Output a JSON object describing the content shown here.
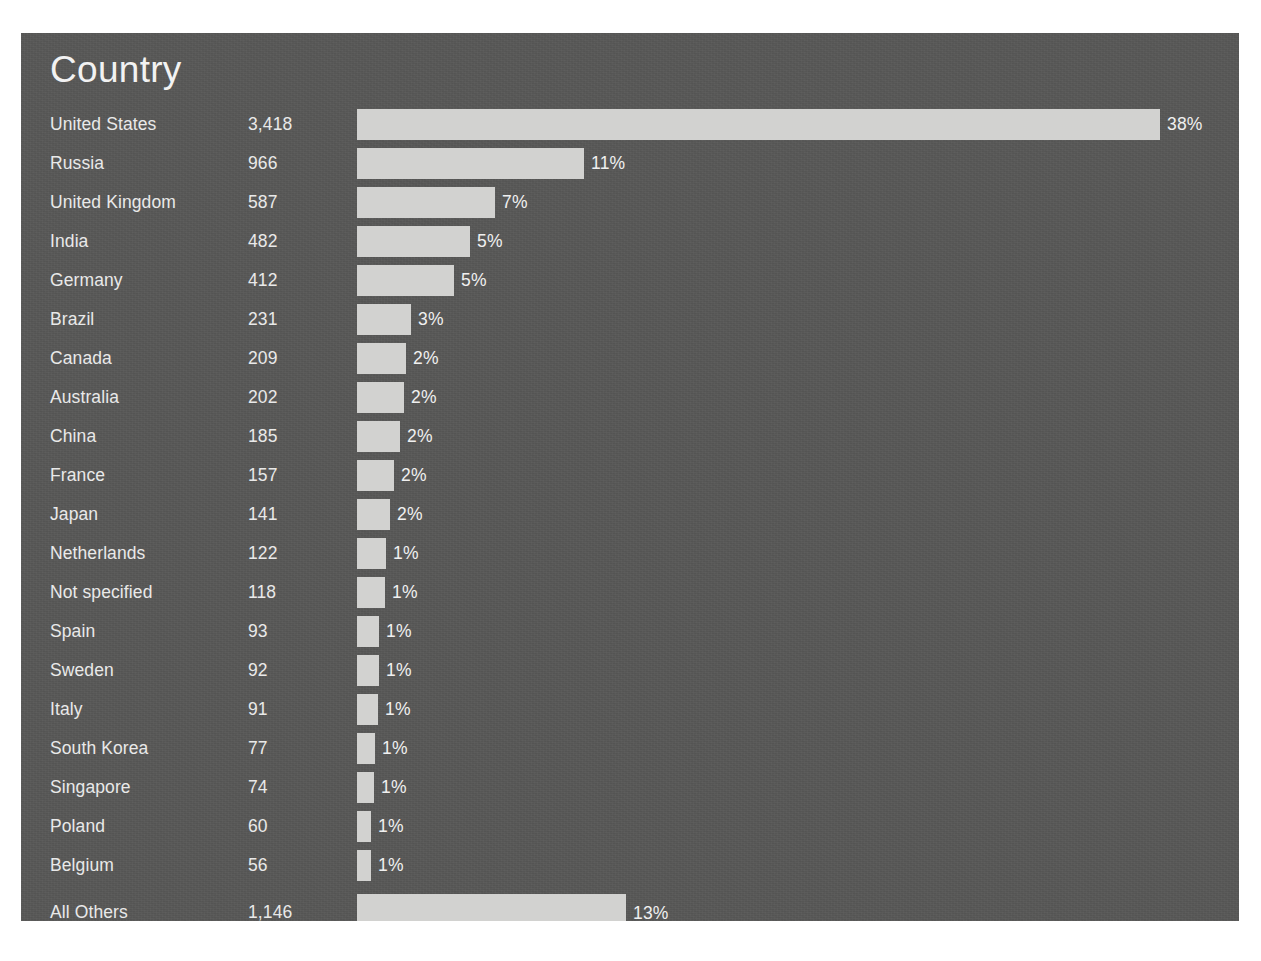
{
  "panel": {
    "background_color": "#585857",
    "bar_color": "#d2d2d0",
    "text_color": "#e9e9e9"
  },
  "header": {
    "title": "Country"
  },
  "chart_data": {
    "type": "bar",
    "orientation": "horizontal",
    "title": "Country",
    "xlabel": "",
    "ylabel": "",
    "grid": false,
    "legend": "none",
    "value_label_format": "percent",
    "max_value": 3418,
    "axis_max": 3418,
    "categories": [
      "United States",
      "Russia",
      "United Kingdom",
      "India",
      "Germany",
      "Brazil",
      "Canada",
      "Australia",
      "China",
      "France",
      "Japan",
      "Netherlands",
      "Not specified",
      "Spain",
      "Sweden",
      "Italy",
      "South Korea",
      "Singapore",
      "Poland",
      "Belgium",
      "All Others"
    ],
    "values": [
      3418,
      966,
      587,
      482,
      412,
      231,
      209,
      202,
      185,
      157,
      141,
      122,
      118,
      93,
      92,
      91,
      77,
      74,
      60,
      56,
      1146
    ],
    "value_labels": [
      "3,418",
      "966",
      "587",
      "482",
      "412",
      "231",
      "209",
      "202",
      "185",
      "157",
      "141",
      "122",
      "118",
      "93",
      "92",
      "91",
      "77",
      "74",
      "60",
      "56",
      "1,146"
    ],
    "percent_labels": [
      "38%",
      "11%",
      "7%",
      "5%",
      "5%",
      "3%",
      "2%",
      "2%",
      "2%",
      "2%",
      "2%",
      "1%",
      "1%",
      "1%",
      "1%",
      "1%",
      "1%",
      "1%",
      "1%",
      "1%",
      "13%"
    ],
    "percents": [
      38,
      11,
      7,
      5,
      5,
      3,
      2,
      2,
      2,
      2,
      2,
      1,
      1,
      1,
      1,
      1,
      1,
      1,
      1,
      1,
      13
    ]
  },
  "rows": [
    {
      "label": "United States",
      "value": "3,418",
      "percent_label": "38%",
      "count": 3418,
      "separated": false
    },
    {
      "label": "Russia",
      "value": "966",
      "percent_label": "11%",
      "count": 966,
      "separated": false
    },
    {
      "label": "United Kingdom",
      "value": "587",
      "percent_label": "7%",
      "count": 587,
      "separated": false
    },
    {
      "label": "India",
      "value": "482",
      "percent_label": "5%",
      "count": 482,
      "separated": false
    },
    {
      "label": "Germany",
      "value": "412",
      "percent_label": "5%",
      "count": 412,
      "separated": false
    },
    {
      "label": "Brazil",
      "value": "231",
      "percent_label": "3%",
      "count": 231,
      "separated": false
    },
    {
      "label": "Canada",
      "value": "209",
      "percent_label": "2%",
      "count": 209,
      "separated": false
    },
    {
      "label": "Australia",
      "value": "202",
      "percent_label": "2%",
      "count": 202,
      "separated": false
    },
    {
      "label": "China",
      "value": "185",
      "percent_label": "2%",
      "count": 185,
      "separated": false
    },
    {
      "label": "France",
      "value": "157",
      "percent_label": "2%",
      "count": 157,
      "separated": false
    },
    {
      "label": "Japan",
      "value": "141",
      "percent_label": "2%",
      "count": 141,
      "separated": false
    },
    {
      "label": "Netherlands",
      "value": "122",
      "percent_label": "1%",
      "count": 122,
      "separated": false
    },
    {
      "label": "Not specified",
      "value": "118",
      "percent_label": "1%",
      "count": 118,
      "separated": false
    },
    {
      "label": "Spain",
      "value": "93",
      "percent_label": "1%",
      "count": 93,
      "separated": false
    },
    {
      "label": "Sweden",
      "value": "92",
      "percent_label": "1%",
      "count": 92,
      "separated": false
    },
    {
      "label": "Italy",
      "value": "91",
      "percent_label": "1%",
      "count": 91,
      "separated": false
    },
    {
      "label": "South Korea",
      "value": "77",
      "percent_label": "1%",
      "count": 77,
      "separated": false
    },
    {
      "label": "Singapore",
      "value": "74",
      "percent_label": "1%",
      "count": 74,
      "separated": false
    },
    {
      "label": "Poland",
      "value": "60",
      "percent_label": "1%",
      "count": 60,
      "separated": false
    },
    {
      "label": "Belgium",
      "value": "56",
      "percent_label": "1%",
      "count": 56,
      "separated": false
    },
    {
      "label": "All Others",
      "value": "1,146",
      "percent_label": "13%",
      "count": 1146,
      "separated": true
    }
  ]
}
